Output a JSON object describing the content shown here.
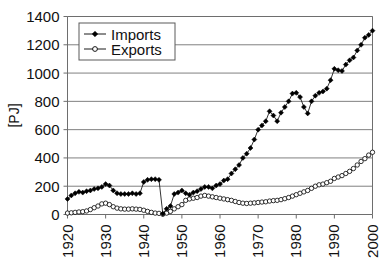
{
  "chart_data": {
    "type": "line",
    "title": "",
    "xlabel": "",
    "ylabel": "[PJ]",
    "xlim": [
      1920,
      2000
    ],
    "ylim": [
      0,
      1400
    ],
    "ytick_labels": [
      "0",
      "200",
      "400",
      "600",
      "800",
      "1000",
      "1200",
      "1400"
    ],
    "ytick_values": [
      0,
      200,
      400,
      600,
      800,
      1000,
      1200,
      1400
    ],
    "xtick_labels": [
      "1920",
      "1930",
      "1940",
      "1950",
      "1960",
      "1970",
      "1980",
      "1990",
      "2000"
    ],
    "xtick_values": [
      1920,
      1930,
      1940,
      1950,
      1960,
      1970,
      1980,
      1990,
      2000
    ],
    "grid": "horizontal",
    "legend_position": "top-left",
    "legend": [
      "Imports",
      "Exports"
    ],
    "x": [
      1920,
      1921,
      1922,
      1923,
      1924,
      1925,
      1926,
      1927,
      1928,
      1929,
      1930,
      1931,
      1932,
      1933,
      1934,
      1935,
      1936,
      1937,
      1938,
      1939,
      1940,
      1941,
      1942,
      1943,
      1944,
      1945,
      1946,
      1947,
      1948,
      1949,
      1950,
      1951,
      1952,
      1953,
      1954,
      1955,
      1956,
      1957,
      1958,
      1959,
      1960,
      1961,
      1962,
      1963,
      1964,
      1965,
      1966,
      1967,
      1968,
      1969,
      1970,
      1971,
      1972,
      1973,
      1974,
      1975,
      1976,
      1977,
      1978,
      1979,
      1980,
      1981,
      1982,
      1983,
      1984,
      1985,
      1986,
      1987,
      1988,
      1989,
      1990,
      1991,
      1992,
      1993,
      1994,
      1995,
      1996,
      1997,
      1998,
      1999,
      2000
    ],
    "series": [
      {
        "name": "Imports",
        "marker": "filled-diamond",
        "values": [
          110,
          135,
          150,
          160,
          155,
          165,
          170,
          180,
          185,
          195,
          215,
          205,
          170,
          150,
          145,
          145,
          145,
          150,
          145,
          150,
          230,
          245,
          250,
          250,
          245,
          5,
          40,
          60,
          145,
          155,
          170,
          150,
          140,
          155,
          165,
          180,
          195,
          195,
          185,
          205,
          215,
          240,
          250,
          290,
          320,
          350,
          400,
          430,
          470,
          530,
          600,
          630,
          660,
          730,
          700,
          660,
          720,
          760,
          800,
          855,
          860,
          830,
          760,
          715,
          800,
          840,
          860,
          870,
          890,
          950,
          1030,
          1020,
          1015,
          1060,
          1090,
          1110,
          1160,
          1200,
          1250,
          1270,
          1300
        ]
      },
      {
        "name": "Exports",
        "marker": "open-circle",
        "values": [
          10,
          12,
          15,
          18,
          20,
          25,
          35,
          48,
          60,
          75,
          80,
          70,
          55,
          45,
          40,
          38,
          38,
          40,
          38,
          36,
          30,
          22,
          15,
          10,
          8,
          2,
          10,
          22,
          40,
          55,
          70,
          100,
          110,
          115,
          120,
          130,
          135,
          130,
          125,
          120,
          115,
          110,
          105,
          100,
          92,
          85,
          80,
          78,
          80,
          82,
          85,
          88,
          90,
          95,
          98,
          100,
          105,
          112,
          120,
          130,
          140,
          150,
          160,
          170,
          185,
          200,
          210,
          215,
          225,
          235,
          255,
          265,
          275,
          290,
          305,
          325,
          350,
          375,
          395,
          420,
          440
        ]
      }
    ]
  },
  "colors": {
    "series_imports": "#000000",
    "series_exports": "#000000",
    "grid": "#808080",
    "frame": "#6e6e6e",
    "text": "#111111",
    "background": "#ffffff"
  }
}
